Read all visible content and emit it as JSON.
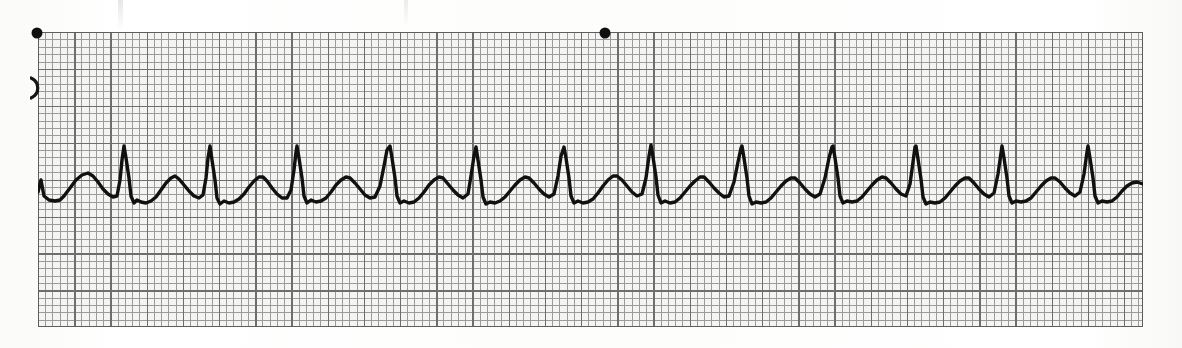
{
  "document": {
    "kind": "ecg-rhythm-strip",
    "paper_color": "#f4f4f2",
    "page_background": "#fdfdfc",
    "grid_minor_color": "#9b9b9b",
    "grid_major_color": "#6e6e6e",
    "trace_color": "#111111",
    "marker_color": "#101010",
    "edge_glyph": ")"
  },
  "strip": {
    "left": 38,
    "top": 32,
    "width": 1105,
    "height": 295,
    "minor_square_px": 7.24,
    "major_square_px": 36.2,
    "minor_squares_across": 152,
    "major_squares_across": 30,
    "major_squares_down": 8
  },
  "interval_markers": [
    {
      "label": "3-second marker",
      "x": 37,
      "y": 33
    },
    {
      "label": "3-second marker",
      "x": 605,
      "y": 33
    }
  ],
  "chart_data": {
    "type": "line",
    "title": "",
    "subtitle": "",
    "xlabel": "",
    "ylabel": "",
    "grid": true,
    "legend": null,
    "paper_speed_mm_per_s": 25,
    "gain_mm_per_mV": 10,
    "baseline_y_px": 196,
    "r_peak_y_px": 146,
    "t_peak_y_px": 176,
    "rr_interval_px": 87,
    "beat_count": 13,
    "r_wave_x_px": [
      124,
      210,
      297,
      390,
      476,
      565,
      651,
      742,
      833,
      915,
      1002,
      1088
    ],
    "series": [
      {
        "name": "ECG lead",
        "units": "mV",
        "points": [
          [
            38,
            192
          ],
          [
            41,
            180
          ],
          [
            44,
            196
          ],
          [
            49,
            200
          ],
          [
            55,
            201
          ],
          [
            60,
            200
          ],
          [
            64,
            196
          ],
          [
            70,
            188
          ],
          [
            76,
            180
          ],
          [
            82,
            175
          ],
          [
            88,
            173
          ],
          [
            93,
            176
          ],
          [
            98,
            182
          ],
          [
            103,
            189
          ],
          [
            108,
            194
          ],
          [
            113,
            197
          ],
          [
            117,
            196
          ],
          [
            120,
            180
          ],
          [
            122,
            160
          ],
          [
            124,
            146
          ],
          [
            126,
            158
          ],
          [
            129,
            178
          ],
          [
            131,
            196
          ],
          [
            134,
            203
          ],
          [
            137,
            200
          ],
          [
            141,
            202
          ],
          [
            146,
            203
          ],
          [
            151,
            201
          ],
          [
            156,
            197
          ],
          [
            161,
            190
          ],
          [
            166,
            183
          ],
          [
            171,
            178
          ],
          [
            175,
            176
          ],
          [
            179,
            179
          ],
          [
            184,
            185
          ],
          [
            189,
            191
          ],
          [
            194,
            196
          ],
          [
            199,
            198
          ],
          [
            203,
            195
          ],
          [
            206,
            178
          ],
          [
            208,
            158
          ],
          [
            210,
            146
          ],
          [
            212,
            160
          ],
          [
            215,
            180
          ],
          [
            217,
            198
          ],
          [
            220,
            204
          ],
          [
            224,
            201
          ],
          [
            229,
            203
          ],
          [
            234,
            202
          ],
          [
            239,
            199
          ],
          [
            244,
            194
          ],
          [
            249,
            187
          ],
          [
            254,
            181
          ],
          [
            259,
            177
          ],
          [
            263,
            177
          ],
          [
            267,
            181
          ],
          [
            272,
            188
          ],
          [
            277,
            194
          ],
          [
            282,
            198
          ],
          [
            287,
            198
          ],
          [
            291,
            190
          ],
          [
            294,
            170
          ],
          [
            296,
            152
          ],
          [
            297,
            146
          ],
          [
            299,
            158
          ],
          [
            302,
            178
          ],
          [
            304,
            196
          ],
          [
            307,
            203
          ],
          [
            311,
            200
          ],
          [
            316,
            202
          ],
          [
            321,
            201
          ],
          [
            326,
            198
          ],
          [
            331,
            192
          ],
          [
            336,
            185
          ],
          [
            341,
            180
          ],
          [
            346,
            177
          ],
          [
            350,
            178
          ],
          [
            355,
            183
          ],
          [
            360,
            189
          ],
          [
            365,
            195
          ],
          [
            370,
            198
          ],
          [
            375,
            197
          ],
          [
            380,
            186
          ],
          [
            384,
            166
          ],
          [
            387,
            150
          ],
          [
            390,
            146
          ],
          [
            392,
            158
          ],
          [
            395,
            178
          ],
          [
            397,
            196
          ],
          [
            400,
            203
          ],
          [
            404,
            201
          ],
          [
            409,
            203
          ],
          [
            414,
            202
          ],
          [
            419,
            198
          ],
          [
            424,
            192
          ],
          [
            429,
            185
          ],
          [
            434,
            180
          ],
          [
            439,
            177
          ],
          [
            443,
            178
          ],
          [
            448,
            184
          ],
          [
            453,
            190
          ],
          [
            458,
            195
          ],
          [
            463,
            198
          ],
          [
            468,
            194
          ],
          [
            471,
            176
          ],
          [
            474,
            156
          ],
          [
            476,
            147
          ],
          [
            478,
            160
          ],
          [
            481,
            180
          ],
          [
            483,
            197
          ],
          [
            486,
            204
          ],
          [
            490,
            202
          ],
          [
            495,
            203
          ],
          [
            500,
            201
          ],
          [
            505,
            197
          ],
          [
            510,
            191
          ],
          [
            515,
            185
          ],
          [
            520,
            180
          ],
          [
            525,
            177
          ],
          [
            529,
            178
          ],
          [
            534,
            183
          ],
          [
            539,
            189
          ],
          [
            544,
            194
          ],
          [
            549,
            197
          ],
          [
            554,
            194
          ],
          [
            558,
            176
          ],
          [
            561,
            156
          ],
          [
            564,
            147
          ],
          [
            566,
            158
          ],
          [
            569,
            178
          ],
          [
            571,
            196
          ],
          [
            574,
            203
          ],
          [
            578,
            201
          ],
          [
            583,
            203
          ],
          [
            588,
            202
          ],
          [
            593,
            199
          ],
          [
            598,
            193
          ],
          [
            603,
            186
          ],
          [
            608,
            180
          ],
          [
            613,
            176
          ],
          [
            617,
            176
          ],
          [
            622,
            180
          ],
          [
            627,
            186
          ],
          [
            632,
            192
          ],
          [
            637,
            196
          ],
          [
            642,
            194
          ],
          [
            646,
            178
          ],
          [
            649,
            156
          ],
          [
            651,
            145
          ],
          [
            653,
            157
          ],
          [
            656,
            177
          ],
          [
            658,
            195
          ],
          [
            661,
            203
          ],
          [
            665,
            201
          ],
          [
            670,
            203
          ],
          [
            675,
            202
          ],
          [
            680,
            198
          ],
          [
            685,
            192
          ],
          [
            690,
            186
          ],
          [
            695,
            181
          ],
          [
            700,
            177
          ],
          [
            704,
            177
          ],
          [
            709,
            182
          ],
          [
            714,
            188
          ],
          [
            719,
            193
          ],
          [
            724,
            197
          ],
          [
            729,
            196
          ],
          [
            734,
            182
          ],
          [
            738,
            162
          ],
          [
            741,
            148
          ],
          [
            742,
            146
          ],
          [
            744,
            158
          ],
          [
            747,
            178
          ],
          [
            749,
            196
          ],
          [
            752,
            204
          ],
          [
            756,
            202
          ],
          [
            761,
            203
          ],
          [
            766,
            202
          ],
          [
            771,
            198
          ],
          [
            776,
            192
          ],
          [
            781,
            186
          ],
          [
            786,
            181
          ],
          [
            791,
            178
          ],
          [
            795,
            178
          ],
          [
            800,
            183
          ],
          [
            805,
            189
          ],
          [
            810,
            194
          ],
          [
            815,
            197
          ],
          [
            820,
            194
          ],
          [
            825,
            178
          ],
          [
            829,
            158
          ],
          [
            832,
            147
          ],
          [
            833,
            146
          ],
          [
            835,
            158
          ],
          [
            838,
            178
          ],
          [
            840,
            196
          ],
          [
            843,
            203
          ],
          [
            847,
            201
          ],
          [
            852,
            202
          ],
          [
            857,
            201
          ],
          [
            862,
            197
          ],
          [
            867,
            191
          ],
          [
            872,
            185
          ],
          [
            877,
            180
          ],
          [
            882,
            177
          ],
          [
            886,
            178
          ],
          [
            891,
            183
          ],
          [
            896,
            189
          ],
          [
            901,
            194
          ],
          [
            906,
            196
          ],
          [
            910,
            184
          ],
          [
            913,
            162
          ],
          [
            915,
            147
          ],
          [
            916,
            146
          ],
          [
            918,
            159
          ],
          [
            921,
            179
          ],
          [
            923,
            197
          ],
          [
            926,
            204
          ],
          [
            930,
            202
          ],
          [
            935,
            203
          ],
          [
            940,
            202
          ],
          [
            945,
            198
          ],
          [
            950,
            192
          ],
          [
            955,
            186
          ],
          [
            960,
            181
          ],
          [
            965,
            178
          ],
          [
            969,
            178
          ],
          [
            974,
            183
          ],
          [
            979,
            189
          ],
          [
            984,
            194
          ],
          [
            989,
            197
          ],
          [
            994,
            193
          ],
          [
            998,
            174
          ],
          [
            1001,
            153
          ],
          [
            1002,
            146
          ],
          [
            1004,
            158
          ],
          [
            1007,
            178
          ],
          [
            1009,
            196
          ],
          [
            1012,
            203
          ],
          [
            1016,
            201
          ],
          [
            1021,
            202
          ],
          [
            1026,
            201
          ],
          [
            1031,
            198
          ],
          [
            1036,
            192
          ],
          [
            1041,
            186
          ],
          [
            1046,
            181
          ],
          [
            1051,
            178
          ],
          [
            1055,
            178
          ],
          [
            1060,
            182
          ],
          [
            1065,
            188
          ],
          [
            1070,
            193
          ],
          [
            1075,
            196
          ],
          [
            1080,
            192
          ],
          [
            1084,
            174
          ],
          [
            1087,
            152
          ],
          [
            1088,
            146
          ],
          [
            1090,
            158
          ],
          [
            1093,
            178
          ],
          [
            1095,
            196
          ],
          [
            1098,
            203
          ],
          [
            1102,
            201
          ],
          [
            1107,
            202
          ],
          [
            1112,
            201
          ],
          [
            1117,
            197
          ],
          [
            1122,
            191
          ],
          [
            1127,
            186
          ],
          [
            1132,
            183
          ],
          [
            1137,
            182
          ],
          [
            1143,
            184
          ]
        ]
      }
    ]
  }
}
